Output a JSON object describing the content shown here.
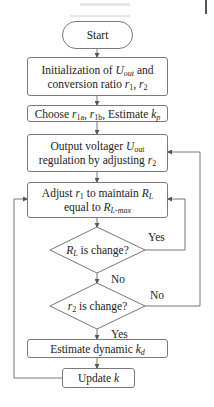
{
  "flowchart": {
    "start": "Start",
    "init": {
      "line1_pre": "Initialization of ",
      "line1_var": "U",
      "line1_sub": "out",
      "line1_post": " and",
      "line2_pre": "conversion ratio ",
      "line2_var1": "r",
      "line2_sub1": "1",
      "line2_sep": ", ",
      "line2_var2": "r",
      "line2_sub2": "2"
    },
    "choose": {
      "pre": "Choose ",
      "var1": "r",
      "sub1": "1a",
      "sep1": ", ",
      "var2": "r",
      "sub2": "1b",
      "mid": ", Estimate ",
      "var3": "k",
      "sub3": "p"
    },
    "output": {
      "line1_pre": "Output voltager ",
      "line1_var": "U",
      "line1_sub": "out",
      "line2_pre": "regulation by adjusting ",
      "line2_var": "r",
      "line2_sub": "2"
    },
    "adjust": {
      "line1_pre": "Adjust ",
      "line1_var1": "r",
      "line1_sub1": "1",
      "line1_mid": " to maintain ",
      "line1_var2": "R",
      "line1_sub2": "L",
      "line2_pre": "equal to ",
      "line2_var": "R",
      "line2_sub": "L-max"
    },
    "decision1": {
      "var": "R",
      "sub": "L",
      "text": " is change?"
    },
    "decision2": {
      "var": "r",
      "sub": "2",
      "text": " is change?"
    },
    "estimate": {
      "pre": "Estimate dynamic ",
      "var": "k",
      "sub": "d"
    },
    "update": {
      "pre": "Update ",
      "var": "k"
    },
    "labels": {
      "d1_yes": "Yes",
      "d1_no": "No",
      "d2_no": "No",
      "d2_yes": "Yes"
    }
  },
  "colors": {
    "stroke": "#7a7a7a",
    "text": "#222222",
    "background": "#ffffff"
  }
}
